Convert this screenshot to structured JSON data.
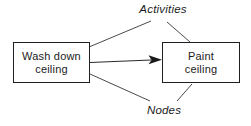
{
  "diagram": {
    "boxes": [
      {
        "id": "wash-down-ceiling",
        "lines": [
          "Wash down",
          "ceiling"
        ]
      },
      {
        "id": "paint-ceiling",
        "lines": [
          "Paint",
          "ceiling"
        ]
      }
    ],
    "edges": [
      {
        "from": "wash-down-ceiling",
        "to": "paint-ceiling",
        "style": "solid-arrow"
      }
    ],
    "labels": {
      "activities": "Activities",
      "nodes": "Nodes"
    },
    "leader_lines": [
      {
        "label": "activities",
        "points_to": "wash-down-ceiling"
      },
      {
        "label": "activities",
        "points_to": "paint-ceiling"
      },
      {
        "label": "nodes",
        "points_to": "wash-down-ceiling"
      },
      {
        "label": "nodes",
        "points_to": "paint-ceiling"
      }
    ],
    "colors": {
      "background": "#ffffff",
      "box_border": "#1f1f1f",
      "box_fill": "#ffffff",
      "line": "#4a4a4a",
      "arrow": "#1a1a1a",
      "text": "#1b1b1b"
    }
  }
}
